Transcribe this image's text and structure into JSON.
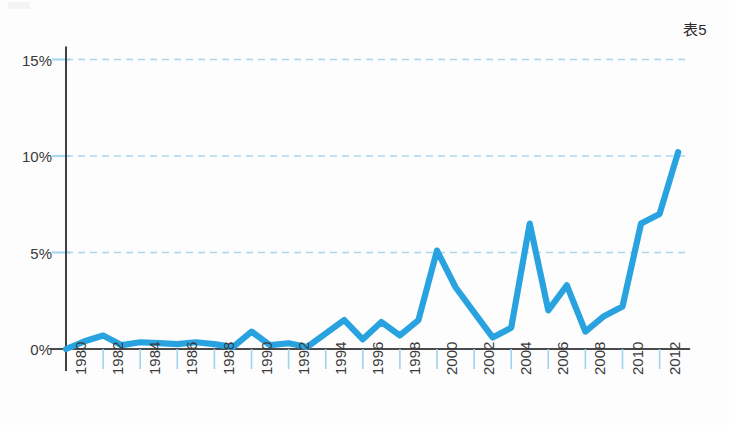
{
  "figure": {
    "label": "表5",
    "corner_mark_name": "page-corner-mark"
  },
  "chart_data": {
    "type": "line",
    "title": "表5",
    "xlabel": "",
    "ylabel": "",
    "xlim": [
      1980,
      2013
    ],
    "ylim": [
      0,
      15
    ],
    "grid": true,
    "grid_axis": "y",
    "legend": "none",
    "line_color": "#29A3E0",
    "grid_color": "#A8D8F0",
    "axis_color": "#4a4a4a",
    "x": [
      1980,
      1981,
      1982,
      1983,
      1984,
      1985,
      1986,
      1987,
      1988,
      1989,
      1990,
      1991,
      1992,
      1993,
      1994,
      1995,
      1996,
      1997,
      1998,
      1999,
      2000,
      2001,
      2002,
      2003,
      2004,
      2005,
      2006,
      2007,
      2008,
      2009,
      2010,
      2011,
      2012,
      2013
    ],
    "values": [
      0.0,
      0.4,
      0.7,
      0.2,
      0.35,
      0.3,
      0.25,
      0.35,
      0.25,
      0.1,
      0.9,
      0.2,
      0.3,
      0.1,
      0.8,
      1.5,
      0.5,
      1.4,
      0.7,
      1.5,
      5.1,
      3.2,
      1.9,
      0.6,
      1.1,
      6.5,
      2.0,
      3.3,
      0.9,
      1.7,
      2.2,
      6.5,
      7.0,
      10.2
    ],
    "yticks": [
      0,
      5,
      10,
      15
    ],
    "ytick_labels": [
      "0%",
      "5%",
      "10%",
      "15%"
    ],
    "xticks": [
      1980,
      1982,
      1984,
      1986,
      1988,
      1990,
      1992,
      1994,
      1996,
      1998,
      2000,
      2002,
      2004,
      2006,
      2008,
      2010,
      2012
    ],
    "xtick_labels": [
      "1980",
      "1982",
      "1984",
      "1986",
      "1988",
      "1990",
      "1992",
      "1994",
      "1996",
      "1998",
      "2000",
      "2002",
      "2004",
      "2006",
      "2008",
      "2010",
      "2012"
    ]
  }
}
